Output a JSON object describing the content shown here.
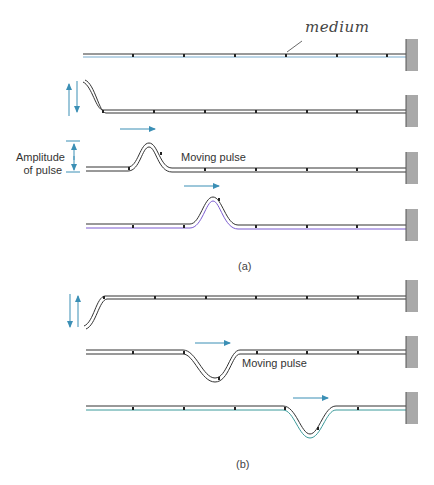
{
  "figure": {
    "labels": {
      "medium": "medium",
      "amplitude_line1": "Amplitude",
      "amplitude_line2": "of pulse",
      "moving_pulse_a": "Moving pulse",
      "moving_pulse_b": "Moving pulse"
    },
    "captions": {
      "a": "(a)",
      "b": "(b)"
    },
    "colors": {
      "arrow": "#3b8fb5",
      "wall": "#a9a9a9",
      "string": "#333333"
    },
    "panels": [
      {
        "id": "a",
        "strings": [
          {
            "row": 1,
            "state": "rest"
          },
          {
            "row": 2,
            "state": "hand moves end up and down"
          },
          {
            "row": 3,
            "state": "upward pulse near left"
          },
          {
            "row": 4,
            "state": "upward pulse moved right"
          }
        ]
      },
      {
        "id": "b",
        "strings": [
          {
            "row": 1,
            "state": "hand moves end down and up"
          },
          {
            "row": 2,
            "state": "downward pulse near left"
          },
          {
            "row": 3,
            "state": "downward pulse moved right"
          }
        ]
      }
    ]
  }
}
